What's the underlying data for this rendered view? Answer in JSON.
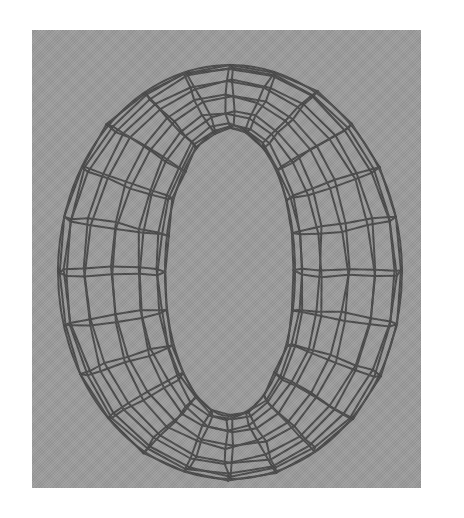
{
  "figure": {
    "background_color": "#9c9c9c",
    "line_color": "#4a4a4a",
    "panel": {
      "x": 32,
      "y": 30,
      "width": 389,
      "height": 458
    },
    "torus": {
      "center": [
        198,
        242
      ],
      "outer_radii": [
        172,
        207
      ],
      "inner_radii": [
        65,
        144
      ],
      "major_segments": 24,
      "minor_segments": 12
    }
  }
}
